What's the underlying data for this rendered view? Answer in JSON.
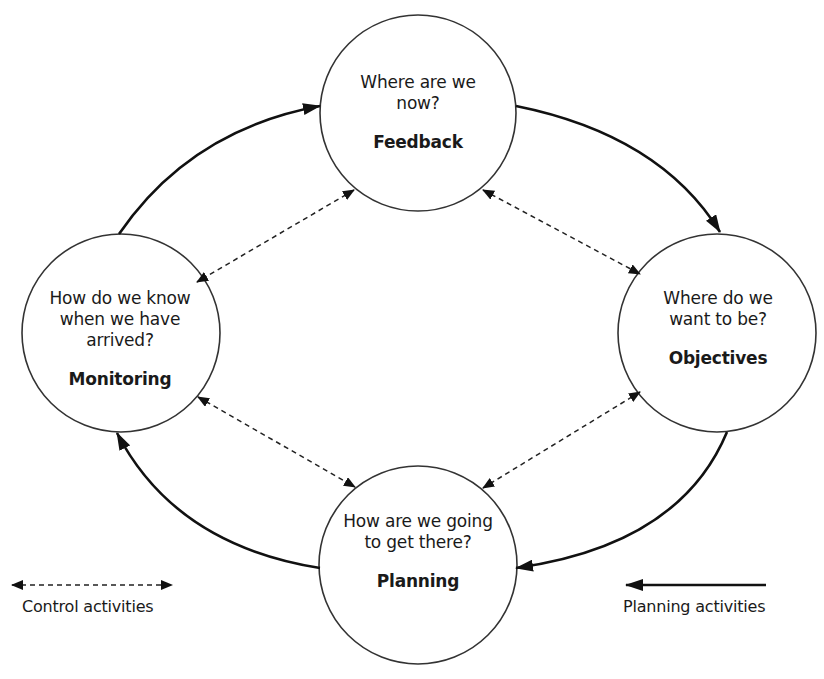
{
  "nodes": {
    "feedback": {
      "question_lines": [
        "Where are we",
        "now?"
      ],
      "label": "Feedback",
      "center": [
        418,
        113
      ],
      "radius": 98
    },
    "objectives": {
      "question_lines": [
        "Where do we",
        "want to be?"
      ],
      "label": "Objectives",
      "center": [
        717,
        333
      ],
      "radius": 99
    },
    "planning": {
      "question_lines": [
        "How are we going",
        "to get there?"
      ],
      "label": "Planning",
      "center": [
        418,
        565
      ],
      "radius": 99
    },
    "monitoring": {
      "question_lines": [
        "How do we know",
        "when we have",
        "arrived?"
      ],
      "label": "Monitoring",
      "center": [
        121,
        333
      ],
      "radius": 99
    }
  },
  "edges": {
    "planning_cycle": [
      {
        "from": "monitoring",
        "to": "feedback",
        "style": "solid"
      },
      {
        "from": "feedback",
        "to": "objectives",
        "style": "solid"
      },
      {
        "from": "objectives",
        "to": "planning",
        "style": "solid"
      },
      {
        "from": "planning",
        "to": "monitoring",
        "style": "solid"
      }
    ],
    "control_links": [
      {
        "between": [
          "feedback",
          "monitoring"
        ],
        "style": "dashed",
        "bidirectional": true
      },
      {
        "between": [
          "feedback",
          "objectives"
        ],
        "style": "dashed",
        "bidirectional": true
      },
      {
        "between": [
          "objectives",
          "planning"
        ],
        "style": "dashed",
        "bidirectional": true
      },
      {
        "between": [
          "monitoring",
          "planning"
        ],
        "style": "dashed",
        "bidirectional": true
      }
    ]
  },
  "legend": {
    "control": {
      "label": "Control activities",
      "line": "dashed",
      "arrows": "both"
    },
    "planning": {
      "label": "Planning activities",
      "line": "solid",
      "arrows": "left"
    }
  },
  "colors": {
    "stroke": "#1a1a1a",
    "circle_stroke": "#333333",
    "background": "#ffffff"
  }
}
